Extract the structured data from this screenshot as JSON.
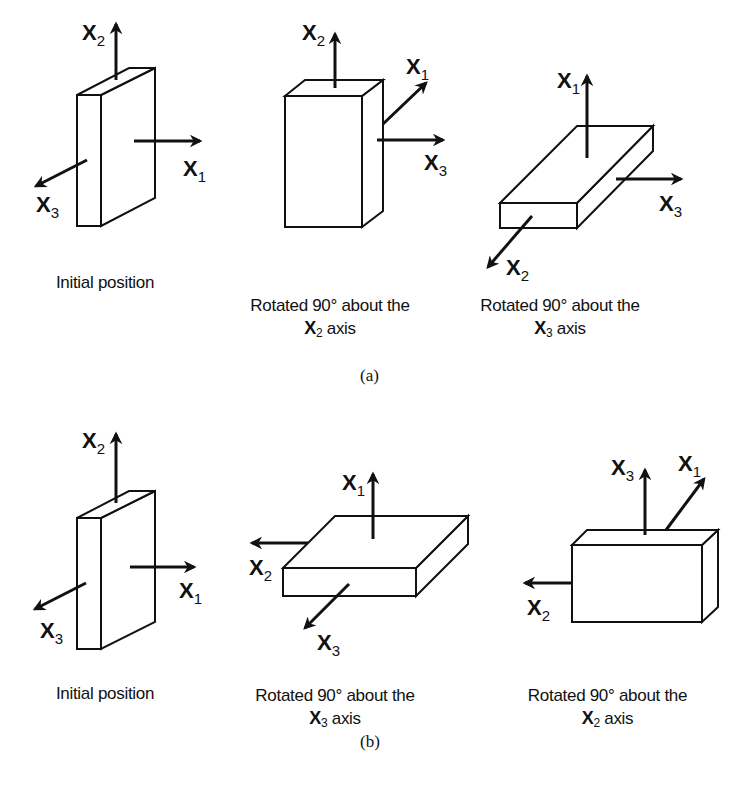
{
  "figure": {
    "parts": [
      {
        "id": "a",
        "label": "(a)",
        "panels": [
          {
            "caption_line1": "Initial position",
            "caption_axis": "",
            "caption_axis_sub": "",
            "caption_line2_suffix": "",
            "axes": [
              {
                "name": "X",
                "sub": "2",
                "dir": "up"
              },
              {
                "name": "X",
                "sub": "1",
                "dir": "right"
              },
              {
                "name": "X",
                "sub": "3",
                "dir": "down-left"
              }
            ]
          },
          {
            "caption_line1": "Rotated 90° about the",
            "caption_axis": "X",
            "caption_axis_sub": "2",
            "caption_line2_suffix": " axis",
            "axes": [
              {
                "name": "X",
                "sub": "2",
                "dir": "up"
              },
              {
                "name": "X",
                "sub": "1",
                "dir": "up-right"
              },
              {
                "name": "X",
                "sub": "3",
                "dir": "right"
              }
            ]
          },
          {
            "caption_line1": "Rotated 90° about the",
            "caption_axis": "X",
            "caption_axis_sub": "3",
            "caption_line2_suffix": " axis",
            "axes": [
              {
                "name": "X",
                "sub": "1",
                "dir": "up"
              },
              {
                "name": "X",
                "sub": "3",
                "dir": "right"
              },
              {
                "name": "X",
                "sub": "2",
                "dir": "down-left"
              }
            ]
          }
        ]
      },
      {
        "id": "b",
        "label": "(b)",
        "panels": [
          {
            "caption_line1": "Initial position",
            "caption_axis": "",
            "caption_axis_sub": "",
            "caption_line2_suffix": "",
            "axes": [
              {
                "name": "X",
                "sub": "2",
                "dir": "up"
              },
              {
                "name": "X",
                "sub": "1",
                "dir": "right"
              },
              {
                "name": "X",
                "sub": "3",
                "dir": "down-left"
              }
            ]
          },
          {
            "caption_line1": "Rotated 90° about the",
            "caption_axis": "X",
            "caption_axis_sub": "3",
            "caption_line2_suffix": " axis",
            "axes": [
              {
                "name": "X",
                "sub": "1",
                "dir": "up"
              },
              {
                "name": "X",
                "sub": "2",
                "dir": "left"
              },
              {
                "name": "X",
                "sub": "3",
                "dir": "down-left"
              }
            ]
          },
          {
            "caption_line1": "Rotated 90° about the",
            "caption_axis": "X",
            "caption_axis_sub": "2",
            "caption_line2_suffix": " axis",
            "axes": [
              {
                "name": "X",
                "sub": "3",
                "dir": "up"
              },
              {
                "name": "X",
                "sub": "1",
                "dir": "up-right"
              },
              {
                "name": "X",
                "sub": "2",
                "dir": "left"
              }
            ]
          }
        ]
      }
    ]
  },
  "labels": {
    "a1": {
      "x2": "X",
      "x2s": "2",
      "x1": "X",
      "x1s": "1",
      "x3": "X",
      "x3s": "3"
    },
    "a2": {
      "x2": "X",
      "x2s": "2",
      "x1": "X",
      "x1s": "1",
      "x3": "X",
      "x3s": "3"
    },
    "a3": {
      "x1": "X",
      "x1s": "1",
      "x3": "X",
      "x3s": "3",
      "x2": "X",
      "x2s": "2"
    },
    "b1": {
      "x2": "X",
      "x2s": "2",
      "x1": "X",
      "x1s": "1",
      "x3": "X",
      "x3s": "3"
    },
    "b2": {
      "x1": "X",
      "x1s": "1",
      "x2": "X",
      "x2s": "2",
      "x3": "X",
      "x3s": "3"
    },
    "b3": {
      "x3": "X",
      "x3s": "3",
      "x1": "X",
      "x1s": "1",
      "x2": "X",
      "x2s": "2"
    }
  },
  "colors": {
    "ink": "#111111",
    "background": "#ffffff"
  }
}
